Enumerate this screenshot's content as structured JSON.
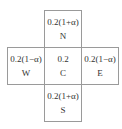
{
  "diagram": {
    "cells": {
      "north": {
        "value": "0.2(1+α)",
        "label": "N"
      },
      "west": {
        "value": "0.2(1−α)",
        "label": "W"
      },
      "center": {
        "value": "0.2",
        "label": "C"
      },
      "east": {
        "value": "0.2(1−α)",
        "label": "E"
      },
      "south": {
        "value": "0.2(1+α)",
        "label": "S"
      }
    },
    "colors": {
      "border": "#9a9a9a",
      "text": "#333333",
      "background": "#ffffff"
    }
  }
}
